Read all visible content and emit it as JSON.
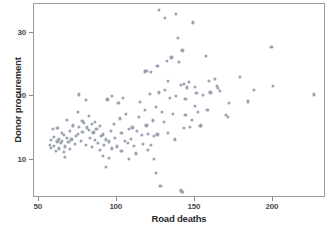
{
  "chart_data": {
    "type": "scatter",
    "title": "",
    "xlabel": "Road deaths",
    "ylabel": "Donor procurement",
    "xlim": [
      47,
      234
    ],
    "ylim": [
      4.0,
      34.5
    ],
    "xticks": [
      50,
      100,
      150,
      200
    ],
    "yticks": [
      10,
      20,
      30
    ],
    "grid": false,
    "legend": null,
    "marker": {
      "shape": "circle",
      "color": "#8a94a6",
      "size_px": 3.2,
      "opacity": 0.85
    },
    "series": [
      {
        "name": "countries",
        "points": [
          [
            57,
            12.4
          ],
          [
            58,
            13.1
          ],
          [
            58,
            11.9
          ],
          [
            59,
            14.8
          ],
          [
            60,
            12.2
          ],
          [
            60,
            13.6
          ],
          [
            61,
            11.4
          ],
          [
            62,
            12.9
          ],
          [
            62,
            15.0
          ],
          [
            63,
            13.3
          ],
          [
            63,
            11.8
          ],
          [
            64,
            12.6
          ],
          [
            65,
            14.2
          ],
          [
            65,
            13.0
          ],
          [
            66,
            11.2
          ],
          [
            66,
            13.9
          ],
          [
            67,
            12.1
          ],
          [
            67,
            10.4
          ],
          [
            68,
            13.4
          ],
          [
            68,
            16.3
          ],
          [
            69,
            12.8
          ],
          [
            70,
            14.6
          ],
          [
            70,
            11.7
          ],
          [
            71,
            13.2
          ],
          [
            72,
            15.4
          ],
          [
            73,
            12.5
          ],
          [
            74,
            13.8
          ],
          [
            75,
            17.6
          ],
          [
            75,
            14.1
          ],
          [
            76,
            20.3
          ],
          [
            76,
            15.2
          ],
          [
            77,
            13.0
          ],
          [
            78,
            16.1
          ],
          [
            78,
            14.4
          ],
          [
            79,
            15.8
          ],
          [
            80,
            19.4
          ],
          [
            80,
            12.3
          ],
          [
            81,
            15.1
          ],
          [
            82,
            14.7
          ],
          [
            82,
            16.9
          ],
          [
            83,
            13.5
          ],
          [
            84,
            15.6
          ],
          [
            84,
            12.0
          ],
          [
            85,
            14.3
          ],
          [
            86,
            15.9
          ],
          [
            86,
            13.1
          ],
          [
            87,
            14.9
          ],
          [
            88,
            12.7
          ],
          [
            89,
            11.5
          ],
          [
            89,
            15.3
          ],
          [
            90,
            13.7
          ],
          [
            91,
            10.6
          ],
          [
            91,
            14.0
          ],
          [
            92,
            12.4
          ],
          [
            93,
            8.9
          ],
          [
            93,
            13.2
          ],
          [
            94,
            19.5
          ],
          [
            95,
            12.9
          ],
          [
            95,
            10.3
          ],
          [
            96,
            14.5
          ],
          [
            97,
            20.1
          ],
          [
            97,
            11.8
          ],
          [
            98,
            15.7
          ],
          [
            99,
            13.4
          ],
          [
            100,
            12.1
          ],
          [
            101,
            18.9
          ],
          [
            102,
            16.5
          ],
          [
            103,
            14.2
          ],
          [
            103,
            11.4
          ],
          [
            104,
            19.8
          ],
          [
            105,
            13.0
          ],
          [
            106,
            17.2
          ],
          [
            107,
            12.6
          ],
          [
            108,
            14.8
          ],
          [
            108,
            10.2
          ],
          [
            109,
            13.3
          ],
          [
            110,
            15.1
          ],
          [
            111,
            12.2
          ],
          [
            112,
            11.0
          ],
          [
            113,
            14.6
          ],
          [
            114,
            16.8
          ],
          [
            115,
            19.1
          ],
          [
            116,
            13.9
          ],
          [
            117,
            12.5
          ],
          [
            118,
            17.9
          ],
          [
            118,
            23.9
          ],
          [
            119,
            24.0
          ],
          [
            119,
            15.4
          ],
          [
            120,
            14.1
          ],
          [
            120,
            11.6
          ],
          [
            121,
            20.4
          ],
          [
            122,
            23.8
          ],
          [
            122,
            12.3
          ],
          [
            123,
            16.2
          ],
          [
            124,
            13.7
          ],
          [
            124,
            10.2
          ],
          [
            125,
            18.3
          ],
          [
            125,
            8.0
          ],
          [
            126,
            24.8
          ],
          [
            126,
            14.0
          ],
          [
            127,
            33.6
          ],
          [
            127,
            20.6
          ],
          [
            128,
            5.9
          ],
          [
            129,
            17.5
          ],
          [
            130,
            15.9
          ],
          [
            131,
            32.3
          ],
          [
            131,
            21.0
          ],
          [
            132,
            25.6
          ],
          [
            133,
            22.4
          ],
          [
            133,
            14.2
          ],
          [
            134,
            19.7
          ],
          [
            135,
            26.1
          ],
          [
            136,
            17.2
          ],
          [
            137,
            13.2
          ],
          [
            138,
            33.0
          ],
          [
            138,
            20.0
          ],
          [
            139,
            29.2
          ],
          [
            140,
            25.4
          ],
          [
            141,
            21.8
          ],
          [
            141,
            5.2
          ],
          [
            142,
            27.2
          ],
          [
            142,
            5.0
          ],
          [
            143,
            22.0
          ],
          [
            143,
            15.0
          ],
          [
            144,
            19.6
          ],
          [
            144,
            17.0
          ],
          [
            145,
            21.4
          ],
          [
            146,
            22.2
          ],
          [
            147,
            15.2
          ],
          [
            148,
            16.3
          ],
          [
            149,
            31.6
          ],
          [
            150,
            21.5
          ],
          [
            150,
            18.5
          ],
          [
            151,
            20.5
          ],
          [
            152,
            17.6
          ],
          [
            153,
            15.3
          ],
          [
            154,
            15.4
          ],
          [
            155,
            20.2
          ],
          [
            157,
            26.4
          ],
          [
            158,
            17.9
          ],
          [
            159,
            22.4
          ],
          [
            160,
            20.6
          ],
          [
            163,
            22.7
          ],
          [
            164,
            21.6
          ],
          [
            165,
            21.3
          ],
          [
            166,
            20.9
          ],
          [
            170,
            17.0
          ],
          [
            171,
            16.8
          ],
          [
            172,
            19.0
          ],
          [
            179,
            23.1
          ],
          [
            184,
            19.2
          ],
          [
            188,
            21.0
          ],
          [
            199,
            27.8
          ],
          [
            200,
            21.6
          ],
          [
            226,
            20.3
          ]
        ]
      }
    ]
  }
}
